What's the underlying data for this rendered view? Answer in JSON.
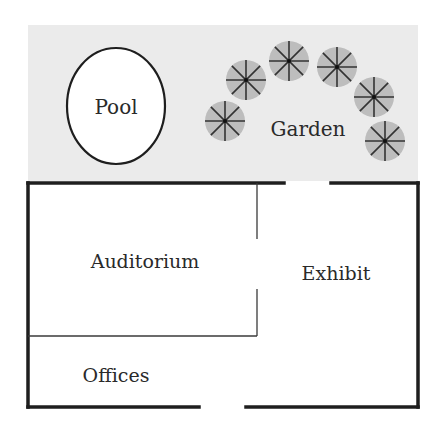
{
  "diagram": {
    "type": "floor-plan",
    "colors": {
      "garden_fill": "#ebebeb",
      "tree_fill": "#bdbdbd",
      "tree_lines": "#333333",
      "wall": "#1e1e1e",
      "pool_fill": "#ffffff"
    },
    "areas": {
      "pool": {
        "label": "Pool"
      },
      "garden": {
        "label": "Garden"
      },
      "auditorium": {
        "label": "Auditorium"
      },
      "exhibit": {
        "label": "Exhibit"
      },
      "offices": {
        "label": "Offices"
      }
    },
    "trees": [
      {
        "cx": 225,
        "cy": 121
      },
      {
        "cx": 246,
        "cy": 80
      },
      {
        "cx": 289,
        "cy": 61
      },
      {
        "cx": 337,
        "cy": 67
      },
      {
        "cx": 374,
        "cy": 97
      },
      {
        "cx": 385,
        "cy": 141
      }
    ],
    "doors": [
      {
        "name": "garden-door",
        "wall": "top"
      },
      {
        "name": "entrance-door",
        "wall": "bottom"
      },
      {
        "name": "auditorium-door",
        "wall": "interior"
      }
    ]
  }
}
